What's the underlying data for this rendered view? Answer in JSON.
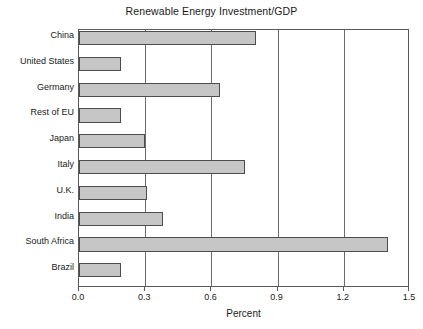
{
  "chart_data": {
    "type": "bar",
    "orientation": "horizontal",
    "title": "Renewable Energy Investment/GDP",
    "xlabel": "Percent",
    "ylabel": "",
    "xlim": [
      0.0,
      1.5
    ],
    "xticks": [
      "0.0",
      "0.3",
      "0.6",
      "0.9",
      "1.2",
      "1.5"
    ],
    "xtick_values": [
      0.0,
      0.3,
      0.6,
      0.9,
      1.2,
      1.5
    ],
    "gridlines": [
      0.3,
      0.6,
      0.9,
      1.2
    ],
    "grid": true,
    "legend": "none",
    "categories": [
      "China",
      "United States",
      "Germany",
      "Rest of EU",
      "Japan",
      "Italy",
      "U.K.",
      "India",
      "South Africa",
      "Brazil"
    ],
    "values": [
      0.8,
      0.19,
      0.64,
      0.19,
      0.3,
      0.75,
      0.31,
      0.38,
      1.4,
      0.19
    ],
    "bar_fill_color": "#c6c6c6",
    "bar_edge_color": "#4d4d4d",
    "axis_color": "#595959",
    "background_color": "#ffffff"
  }
}
